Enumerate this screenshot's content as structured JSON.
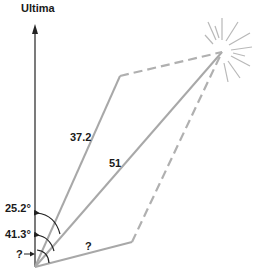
{
  "diagram": {
    "axis_label": "Ultima",
    "side_upper_label": "37.2",
    "diagonal_label": "51",
    "side_lower_label": "?",
    "angle_upper_label": "25.2°",
    "angle_diagonal_label": "41.3°",
    "angle_lower_label": "?",
    "colors": {
      "axis": "#222222",
      "vector": "#a8a8a8",
      "dashed": "#b0b0b0",
      "burst": "#b8b8b8",
      "text": "#1a1a1a"
    }
  }
}
